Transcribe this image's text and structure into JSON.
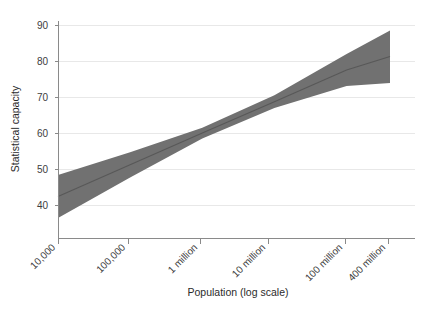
{
  "chart_data": {
    "type": "area",
    "title": "",
    "subtitle": "",
    "xlabel": "Population (log scale)",
    "ylabel": "Statistical capacity",
    "grid": "horizontal",
    "legend": "none",
    "x_scale": "log10",
    "x_ticks": [
      {
        "label": "10,000",
        "value": 10000
      },
      {
        "label": "100,000",
        "value": 100000
      },
      {
        "label": "1 million",
        "value": 1000000
      },
      {
        "label": "10 million",
        "value": 10000000
      },
      {
        "label": "100 million",
        "value": 100000000
      },
      {
        "label": "400 million",
        "value": 400000000
      }
    ],
    "y_ticks": [
      {
        "label": "40",
        "value": 40
      },
      {
        "label": "50",
        "value": 50
      },
      {
        "label": "60",
        "value": 60
      },
      {
        "label": "70",
        "value": 70
      },
      {
        "label": "80",
        "value": 80
      },
      {
        "label": "90",
        "value": 90
      }
    ],
    "xlim_log10": [
      4.0,
      8.602
    ],
    "ylim": [
      36,
      92
    ],
    "series": [
      {
        "name": "Fitted statistical capacity",
        "kind": "line",
        "color": "#585858",
        "x": [
          10000,
          100000,
          1000000,
          10000000,
          100000000,
          400000000
        ],
        "values": [
          42.5,
          51.3,
          60.1,
          68.8,
          77.6,
          81.4
        ]
      },
      {
        "name": "95% confidence interval",
        "kind": "band",
        "color": "#717171",
        "x": [
          10000,
          100000,
          1000000,
          10000000,
          100000000,
          400000000
        ],
        "upper": [
          48.5,
          54.8,
          61.6,
          70.6,
          82.1,
          88.6
        ],
        "lower": [
          36.5,
          47.8,
          58.6,
          67.1,
          73.2,
          74.0
        ]
      }
    ]
  },
  "axes": {
    "y_title": "Statistical capacity",
    "x_title": "Population (log scale)"
  }
}
